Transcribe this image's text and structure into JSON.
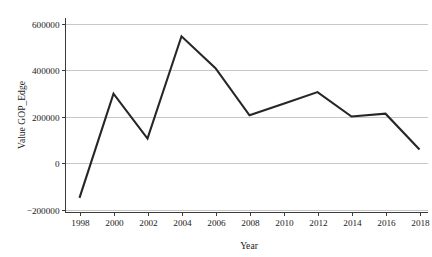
{
  "chart_data": {
    "type": "line",
    "title": "",
    "xlabel": "Year",
    "ylabel": "Value GOP_Edge",
    "x": [
      1998,
      2000,
      2002,
      2004,
      2006,
      2008,
      2010,
      2012,
      2014,
      2016,
      2018
    ],
    "values": [
      -150000,
      298000,
      105000,
      545000,
      408000,
      205000,
      255000,
      305000,
      200000,
      212000,
      58000
    ],
    "series": [
      {
        "name": "Value GOP_Edge",
        "values": [
          -150000,
          298000,
          105000,
          545000,
          408000,
          205000,
          255000,
          305000,
          200000,
          212000,
          58000
        ]
      }
    ],
    "xtick_labels": [
      "1998",
      "2000",
      "2002",
      "2004",
      "2006",
      "2008",
      "2010",
      "2012",
      "2014",
      "2016",
      "2018"
    ],
    "ytick_labels": [
      "600000",
      "400000",
      "200000",
      "0",
      "-200000"
    ],
    "ytick_values": [
      600000,
      400000,
      200000,
      0,
      -200000
    ],
    "xlim": [
      1997,
      2019
    ],
    "ylim": [
      -230000,
      620000
    ],
    "grid": "horizontal",
    "legend": "none",
    "line_color": "#262626",
    "grid_color": "#b9b9b9",
    "axis_color": "#3b3b3b",
    "background_color": "#ffffff"
  }
}
